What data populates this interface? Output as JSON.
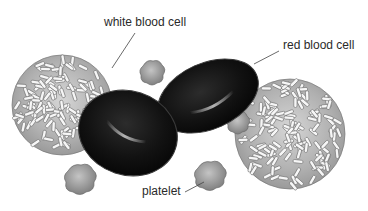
{
  "figure": {
    "labels": {
      "white_blood_cell": "white blood cell",
      "red_blood_cell": "red blood cell",
      "platelet": "platelet"
    },
    "colors": {
      "background": "#ffffff",
      "red_blood_cell": "#141414",
      "red_blood_cell_highlight": "#8a8a8a",
      "white_blood_cell_body": "#b8b8b8",
      "white_blood_cell_granule": "#f4f4f4",
      "platelet": "#9a9a9a",
      "leader_line": "#444444",
      "text": "#2a2a2a"
    },
    "elements": {
      "white_blood_cells": 2,
      "red_blood_cells": 2,
      "platelets": 4
    }
  }
}
